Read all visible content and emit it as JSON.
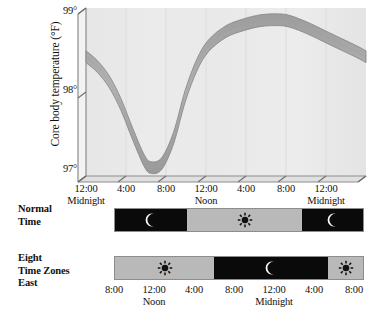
{
  "chart_data": {
    "type": "line",
    "title": "",
    "ylabel": "Core body temperature (°F)",
    "xlabel": "",
    "ylim": [
      97,
      99
    ],
    "y_ticks": [
      "97°",
      "98°",
      "99°"
    ],
    "y_tick_values": [
      97,
      98,
      99
    ],
    "x_ticks": [
      "12:00",
      "4:00",
      "8:00",
      "12:00",
      "4:00",
      "8:00",
      "12:00"
    ],
    "x_tick_subs": [
      "Midnight",
      "",
      "",
      "Noon",
      "",
      "",
      "Midnight"
    ],
    "x_tick_hours": [
      0,
      4,
      8,
      12,
      16,
      20,
      24
    ],
    "grid": false,
    "legend": "none",
    "series": [
      {
        "name": "Core body temperature",
        "x": [
          0,
          1,
          2,
          3,
          4,
          5,
          5.6,
          6.5,
          7.5,
          8.5,
          9.5,
          10.5,
          12,
          13.5,
          15,
          16.5,
          17.5,
          19,
          20.5,
          22,
          23.2,
          24
        ],
        "values": [
          98.42,
          98.3,
          98.12,
          97.85,
          97.5,
          97.18,
          97.1,
          97.15,
          97.45,
          97.95,
          98.32,
          98.55,
          98.72,
          98.8,
          98.85,
          98.86,
          98.84,
          98.76,
          98.66,
          98.56,
          98.48,
          98.42
        ],
        "band_halfwidth": 0.07
      }
    ],
    "colors": {
      "band_fill": "#a8a8a8",
      "band_edge": "#8a8a8a",
      "plot_bg": "#ededed",
      "axis": "#8d8d8d"
    }
  },
  "timelines": [
    {
      "label_lines": [
        "Normal",
        "Time"
      ],
      "label_name": "normal-time-label",
      "segments": [
        {
          "state": "night",
          "icon": "moon-icon",
          "width_pct": 29.0
        },
        {
          "state": "day",
          "icon": "sun-icon",
          "width_pct": 46.5
        },
        {
          "state": "night",
          "icon": "moon-icon",
          "width_pct": 24.5
        }
      ],
      "ticks_position": "above",
      "ticks": [
        {
          "time": "12:00",
          "sub": "Midnight",
          "hour": 0
        },
        {
          "time": "4:00",
          "sub": "",
          "hour": 4
        },
        {
          "time": "8:00",
          "sub": "",
          "hour": 8
        },
        {
          "time": "12:00",
          "sub": "Noon",
          "hour": 12
        },
        {
          "time": "4:00",
          "sub": "",
          "hour": 16
        },
        {
          "time": "8:00",
          "sub": "",
          "hour": 20
        },
        {
          "time": "12:00",
          "sub": "Midnight",
          "hour": 24
        }
      ]
    },
    {
      "label_lines": [
        "Eight",
        "Time Zones",
        "East"
      ],
      "label_name": "eight-time-zones-east-label",
      "segments": [
        {
          "state": "day",
          "icon": "sun-icon",
          "width_pct": 40.0
        },
        {
          "state": "night",
          "icon": "moon-icon",
          "width_pct": 46.0
        },
        {
          "state": "day",
          "icon": "sun-icon",
          "width_pct": 14.0
        }
      ],
      "ticks_position": "below",
      "ticks": [
        {
          "time": "8:00",
          "sub": "",
          "hour": 0
        },
        {
          "time": "12:00",
          "sub": "Noon",
          "hour": 4
        },
        {
          "time": "4:00",
          "sub": "",
          "hour": 8
        },
        {
          "time": "8:00",
          "sub": "",
          "hour": 12
        },
        {
          "time": "12:00",
          "sub": "Midnight",
          "hour": 16
        },
        {
          "time": "4:00",
          "sub": "",
          "hour": 20
        },
        {
          "time": "8:00",
          "sub": "",
          "hour": 24
        }
      ]
    }
  ]
}
